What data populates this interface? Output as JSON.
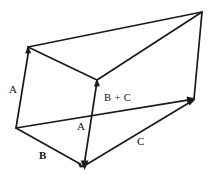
{
  "figure": {
    "type": "line-diagram",
    "width": 209,
    "height": 175,
    "background_color": "#ffffff",
    "stroke_color": "#1a1a1a",
    "label_color": "#111111",
    "labels": {
      "a_left": "A",
      "b_plus_c": "B + C",
      "a_middle": "A",
      "b": "B",
      "c": "C"
    },
    "vertices": {
      "top_left": [
        28,
        47
      ],
      "top_right": [
        202,
        12
      ],
      "interior_apex": [
        97,
        80
      ],
      "bottom_left": [
        16,
        128
      ],
      "bottom_center": [
        84,
        166
      ],
      "right_middle": [
        194,
        99
      ]
    },
    "edges": [
      {
        "name": "top-left-to-top-right",
        "from": [
          28,
          47
        ],
        "to": [
          202,
          12
        ],
        "arrow": false
      },
      {
        "name": "top-left-to-interior-apex",
        "from": [
          28,
          47
        ],
        "to": [
          97,
          80
        ],
        "arrow": false
      },
      {
        "name": "interior-apex-to-top-right",
        "from": [
          97,
          80
        ],
        "to": [
          202,
          12
        ],
        "arrow": false
      },
      {
        "name": "vector-a-left",
        "from": [
          16,
          128
        ],
        "to": [
          28,
          47
        ],
        "arrow": true
      },
      {
        "name": "vector-a-middle",
        "from": [
          84,
          166
        ],
        "to": [
          97,
          80
        ],
        "arrow": true
      },
      {
        "name": "vector-b-plus-c",
        "from": [
          16,
          128
        ],
        "to": [
          194,
          99
        ],
        "arrow": true
      },
      {
        "name": "vector-b",
        "from": [
          16,
          128
        ],
        "to": [
          84,
          166
        ],
        "arrow": true
      },
      {
        "name": "vector-c",
        "from": [
          84,
          166
        ],
        "to": [
          194,
          99
        ],
        "arrow": true
      },
      {
        "name": "right-edge-top-right-to-right-middle",
        "from": [
          202,
          12
        ],
        "to": [
          194,
          99
        ],
        "arrow": false
      }
    ]
  }
}
